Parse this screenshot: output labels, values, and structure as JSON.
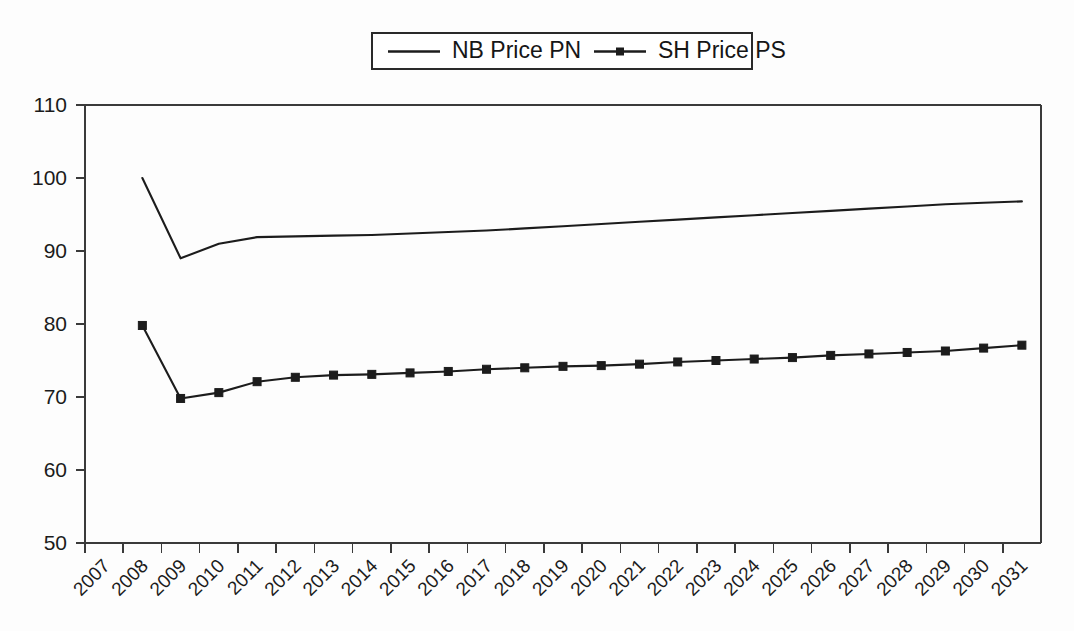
{
  "chart_data": {
    "type": "line",
    "title": "",
    "subtitle": "",
    "xlabel": "",
    "ylabel": "",
    "ylim": [
      50,
      110
    ],
    "ytick_step": 10,
    "yticks": [
      50,
      60,
      70,
      80,
      90,
      100,
      110
    ],
    "grid": false,
    "legend_position": "top-center",
    "categories": [
      "2007",
      "2008",
      "2009",
      "2010",
      "2011",
      "2012",
      "2013",
      "2014",
      "2015",
      "2016",
      "2017",
      "2018",
      "2019",
      "2020",
      "2021",
      "2022",
      "2023",
      "2024",
      "2025",
      "2026",
      "2027",
      "2028",
      "2029",
      "2030",
      "2031"
    ],
    "x_start_category": "2008",
    "series": [
      {
        "name": "NB Price PN",
        "marker": "none",
        "color": "#1c1c1c",
        "x": [
          "2008",
          "2009",
          "2010",
          "2011",
          "2012",
          "2013",
          "2014",
          "2015",
          "2016",
          "2017",
          "2018",
          "2019",
          "2020",
          "2021",
          "2022",
          "2023",
          "2024",
          "2025",
          "2026",
          "2027",
          "2028",
          "2029",
          "2030",
          "2031"
        ],
        "values": [
          100.0,
          89.0,
          91.0,
          91.9,
          92.0,
          92.1,
          92.2,
          92.4,
          92.6,
          92.8,
          93.1,
          93.4,
          93.7,
          94.0,
          94.3,
          94.6,
          94.9,
          95.2,
          95.5,
          95.8,
          96.1,
          96.4,
          96.6,
          96.8
        ]
      },
      {
        "name": "SH Price PS",
        "marker": "square",
        "color": "#1c1c1c",
        "x": [
          "2008",
          "2009",
          "2010",
          "2011",
          "2012",
          "2013",
          "2014",
          "2015",
          "2016",
          "2017",
          "2018",
          "2019",
          "2020",
          "2021",
          "2022",
          "2023",
          "2024",
          "2025",
          "2026",
          "2027",
          "2028",
          "2029",
          "2030",
          "2031"
        ],
        "values": [
          79.8,
          69.8,
          70.6,
          72.1,
          72.7,
          73.0,
          73.1,
          73.3,
          73.5,
          73.8,
          74.0,
          74.2,
          74.3,
          74.5,
          74.8,
          75.0,
          75.2,
          75.4,
          75.7,
          75.9,
          76.1,
          76.3,
          76.7,
          77.1
        ]
      }
    ]
  },
  "legend": {
    "entries": [
      {
        "label": "NB Price PN",
        "marker": "line"
      },
      {
        "label": "SH Price PS",
        "marker": "line-square"
      }
    ]
  }
}
